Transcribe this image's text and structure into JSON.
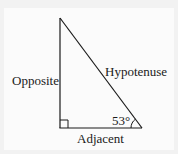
{
  "diagram": {
    "type": "right-triangle",
    "labels": {
      "opposite": "Opposite",
      "hypotenuse": "Hypotenuse",
      "adjacent": "Adjacent",
      "angle": "53°"
    },
    "angle_degrees": 53,
    "colors": {
      "stroke": "#1a1a1a",
      "background": "#fbfbfb"
    }
  }
}
